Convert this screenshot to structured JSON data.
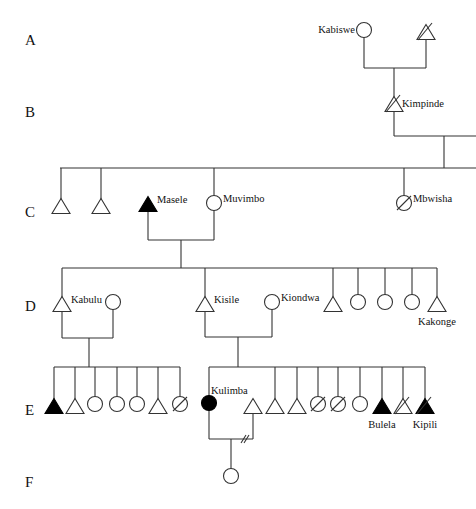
{
  "diagram": {
    "type": "kinship-genealogy",
    "generations": [
      {
        "id": "A",
        "label": "A",
        "y": 40
      },
      {
        "id": "B",
        "label": "B",
        "y": 112
      },
      {
        "id": "C",
        "label": "C",
        "y": 212
      },
      {
        "id": "D",
        "label": "D",
        "y": 306
      },
      {
        "id": "E",
        "label": "E",
        "y": 410
      },
      {
        "id": "F",
        "label": "F",
        "y": 482
      }
    ],
    "legend_conventions": {
      "triangle": "male",
      "circle": "female",
      "filled": "highlighted individual",
      "slash": "deceased",
      "double_slash_on_marriage_line": "divorce"
    },
    "individuals": [
      {
        "id": "kabiswe",
        "name": "Kabiswe",
        "gen": "A",
        "sex": "female",
        "x": 364,
        "y": 30,
        "filled": false,
        "deceased": false,
        "label_pos": "left"
      },
      {
        "id": "a_male",
        "name": "",
        "gen": "A",
        "sex": "male",
        "x": 426,
        "y": 32,
        "filled": false,
        "deceased": true
      },
      {
        "id": "kimpinde",
        "name": "Kimpinde",
        "gen": "B",
        "sex": "male",
        "x": 394,
        "y": 104,
        "filled": false,
        "deceased": true,
        "label_pos": "right"
      },
      {
        "id": "c1",
        "name": "",
        "gen": "C",
        "sex": "male",
        "x": 61,
        "y": 206,
        "filled": false,
        "deceased": false
      },
      {
        "id": "c2",
        "name": "",
        "gen": "C",
        "sex": "male",
        "x": 101,
        "y": 206,
        "filled": false,
        "deceased": false
      },
      {
        "id": "masele",
        "name": "Masele",
        "gen": "C",
        "sex": "male",
        "x": 148,
        "y": 204,
        "filled": true,
        "deceased": false,
        "label_pos": "right"
      },
      {
        "id": "muvimbo",
        "name": "Muvimbo",
        "gen": "C",
        "sex": "female",
        "x": 214,
        "y": 203,
        "filled": false,
        "deceased": false,
        "label_pos": "right"
      },
      {
        "id": "mbwisha",
        "name": "Mbwisha",
        "gen": "C",
        "sex": "female",
        "x": 404,
        "y": 203,
        "filled": false,
        "deceased": true,
        "label_pos": "right"
      },
      {
        "id": "kabulu",
        "name": "Kabulu",
        "gen": "D",
        "sex": "male",
        "x": 62,
        "y": 304,
        "filled": false,
        "deceased": false,
        "label_pos": "right"
      },
      {
        "id": "kabulu_wife",
        "name": "",
        "gen": "D",
        "sex": "female",
        "x": 113,
        "y": 302,
        "filled": false,
        "deceased": false
      },
      {
        "id": "kisile",
        "name": "Kisile",
        "gen": "D",
        "sex": "male",
        "x": 205,
        "y": 304,
        "filled": false,
        "deceased": false,
        "label_pos": "right"
      },
      {
        "id": "kiondwa",
        "name": "Kiondwa",
        "gen": "D",
        "sex": "female",
        "x": 272,
        "y": 302,
        "filled": false,
        "deceased": false,
        "label_pos": "right"
      },
      {
        "id": "d5",
        "name": "",
        "gen": "D",
        "sex": "male",
        "x": 333,
        "y": 304,
        "filled": false,
        "deceased": false
      },
      {
        "id": "d6",
        "name": "",
        "gen": "D",
        "sex": "female",
        "x": 358,
        "y": 302,
        "filled": false,
        "deceased": false
      },
      {
        "id": "d7",
        "name": "",
        "gen": "D",
        "sex": "female",
        "x": 385,
        "y": 302,
        "filled": false,
        "deceased": false
      },
      {
        "id": "d8",
        "name": "",
        "gen": "D",
        "sex": "female",
        "x": 412,
        "y": 302,
        "filled": false,
        "deceased": false
      },
      {
        "id": "kakonge",
        "name": "Kakonge",
        "gen": "D",
        "sex": "male",
        "x": 437,
        "y": 304,
        "filled": false,
        "deceased": false,
        "label_pos": "below"
      },
      {
        "id": "e1",
        "name": "",
        "gen": "E",
        "sex": "male",
        "x": 54,
        "y": 406,
        "filled": true,
        "deceased": false
      },
      {
        "id": "e2",
        "name": "",
        "gen": "E",
        "sex": "male",
        "x": 75,
        "y": 406,
        "filled": false,
        "deceased": false
      },
      {
        "id": "e3",
        "name": "",
        "gen": "E",
        "sex": "female",
        "x": 95,
        "y": 404,
        "filled": false,
        "deceased": false
      },
      {
        "id": "e4",
        "name": "",
        "gen": "E",
        "sex": "female",
        "x": 117,
        "y": 404,
        "filled": false,
        "deceased": false
      },
      {
        "id": "e5",
        "name": "",
        "gen": "E",
        "sex": "female",
        "x": 137,
        "y": 404,
        "filled": false,
        "deceased": false
      },
      {
        "id": "e6",
        "name": "",
        "gen": "E",
        "sex": "male",
        "x": 158,
        "y": 406,
        "filled": false,
        "deceased": false
      },
      {
        "id": "e7",
        "name": "",
        "gen": "E",
        "sex": "female",
        "x": 180,
        "y": 404,
        "filled": false,
        "deceased": true
      },
      {
        "id": "kulimba",
        "name": "Kulimba",
        "gen": "E",
        "sex": "female",
        "x": 209,
        "y": 403,
        "filled": true,
        "deceased": false,
        "label_pos": "right-up"
      },
      {
        "id": "kulimba_husband",
        "name": "",
        "gen": "E",
        "sex": "male",
        "x": 253,
        "y": 406,
        "filled": false,
        "deceased": false
      },
      {
        "id": "e10",
        "name": "",
        "gen": "E",
        "sex": "male",
        "x": 275,
        "y": 406,
        "filled": false,
        "deceased": false
      },
      {
        "id": "e11",
        "name": "",
        "gen": "E",
        "sex": "male",
        "x": 297,
        "y": 406,
        "filled": false,
        "deceased": false
      },
      {
        "id": "e12",
        "name": "",
        "gen": "E",
        "sex": "female",
        "x": 318,
        "y": 404,
        "filled": false,
        "deceased": true
      },
      {
        "id": "e13",
        "name": "",
        "gen": "E",
        "sex": "female",
        "x": 338,
        "y": 404,
        "filled": false,
        "deceased": true
      },
      {
        "id": "e14",
        "name": "",
        "gen": "E",
        "sex": "female",
        "x": 360,
        "y": 404,
        "filled": false,
        "deceased": false
      },
      {
        "id": "bulela",
        "name": "Bulela",
        "gen": "E",
        "sex": "male",
        "x": 382,
        "y": 406,
        "filled": true,
        "deceased": false,
        "label_pos": "below"
      },
      {
        "id": "e16",
        "name": "",
        "gen": "E",
        "sex": "male",
        "x": 403,
        "y": 406,
        "filled": false,
        "deceased": true
      },
      {
        "id": "kipili",
        "name": "Kipili",
        "gen": "E",
        "sex": "male",
        "x": 425,
        "y": 406,
        "filled": true,
        "deceased": true,
        "label_pos": "below"
      },
      {
        "id": "f1",
        "name": "",
        "gen": "F",
        "sex": "female",
        "x": 231,
        "y": 476,
        "filled": false,
        "deceased": false
      }
    ],
    "lines": [
      [
        364,
        37,
        364,
        68
      ],
      [
        426,
        39,
        426,
        68
      ],
      [
        364,
        68,
        426,
        68
      ],
      [
        394,
        68,
        394,
        97
      ],
      [
        394,
        111,
        394,
        136
      ],
      [
        394,
        136,
        476,
        136
      ],
      [
        444,
        136,
        444,
        168
      ],
      [
        60,
        168,
        476,
        168
      ],
      [
        61,
        168,
        61,
        199
      ],
      [
        101,
        168,
        101,
        199
      ],
      [
        214,
        168,
        214,
        196
      ],
      [
        404,
        168,
        404,
        196
      ],
      [
        148,
        211,
        148,
        240
      ],
      [
        214,
        210,
        214,
        240
      ],
      [
        148,
        240,
        214,
        240
      ],
      [
        181,
        240,
        181,
        268
      ],
      [
        62,
        268,
        437,
        268
      ],
      [
        62,
        268,
        62,
        297
      ],
      [
        205,
        268,
        205,
        297
      ],
      [
        333,
        268,
        333,
        297
      ],
      [
        358,
        268,
        358,
        295
      ],
      [
        385,
        268,
        385,
        295
      ],
      [
        412,
        268,
        412,
        295
      ],
      [
        437,
        268,
        437,
        297
      ],
      [
        62,
        311,
        62,
        338
      ],
      [
        113,
        309,
        113,
        338
      ],
      [
        62,
        338,
        113,
        338
      ],
      [
        89,
        338,
        89,
        367
      ],
      [
        54,
        367,
        180,
        367
      ],
      [
        54,
        367,
        54,
        399
      ],
      [
        75,
        367,
        75,
        399
      ],
      [
        95,
        367,
        95,
        397
      ],
      [
        117,
        367,
        117,
        397
      ],
      [
        137,
        367,
        137,
        397
      ],
      [
        158,
        367,
        158,
        399
      ],
      [
        180,
        367,
        180,
        397
      ],
      [
        205,
        311,
        205,
        337
      ],
      [
        272,
        309,
        272,
        337
      ],
      [
        205,
        337,
        272,
        337
      ],
      [
        238,
        337,
        238,
        367
      ],
      [
        209,
        367,
        425,
        367
      ],
      [
        209,
        367,
        209,
        396
      ],
      [
        275,
        367,
        275,
        399
      ],
      [
        297,
        367,
        297,
        399
      ],
      [
        318,
        367,
        318,
        397
      ],
      [
        338,
        367,
        338,
        397
      ],
      [
        360,
        367,
        360,
        397
      ],
      [
        382,
        367,
        382,
        399
      ],
      [
        403,
        367,
        403,
        399
      ],
      [
        425,
        367,
        425,
        399
      ],
      [
        209,
        410,
        209,
        439
      ],
      [
        253,
        413,
        253,
        439
      ],
      [
        209,
        439,
        253,
        439
      ],
      [
        231,
        439,
        231,
        469
      ]
    ],
    "divorce_mark": {
      "x": 245,
      "y": 439
    }
  }
}
